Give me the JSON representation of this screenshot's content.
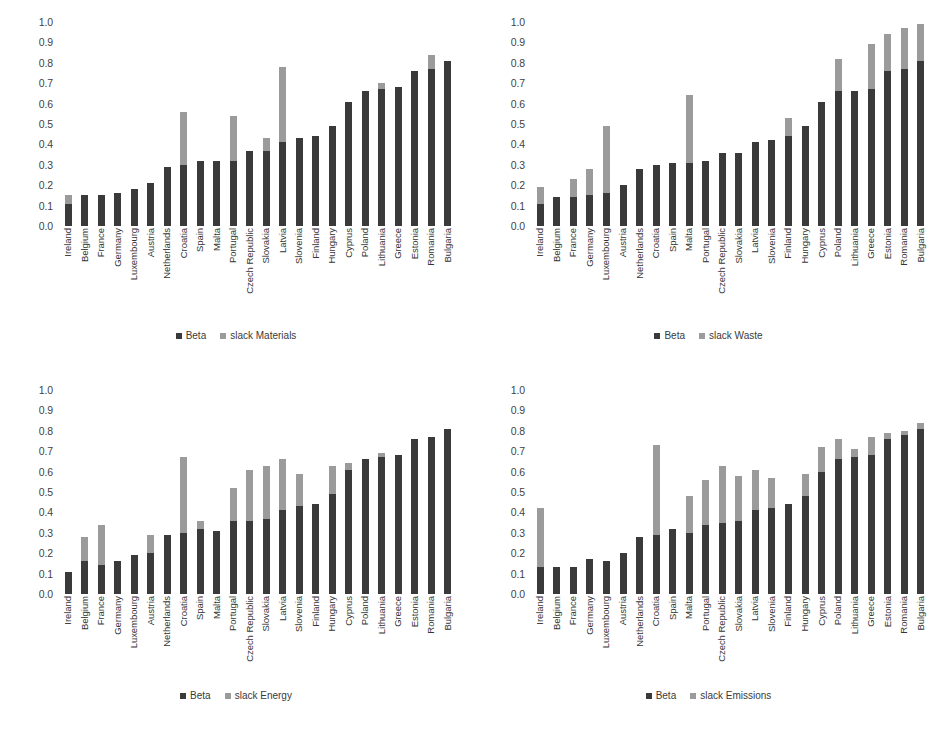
{
  "figure": {
    "colors": {
      "beta": "#3a3a3a",
      "slack": "#9b9b9b",
      "text": "#3a3a3a",
      "background": "#ffffff"
    },
    "y_ticks": [
      "1.0",
      "0.9",
      "0.8",
      "0.7",
      "0.6",
      "0.5",
      "0.4",
      "0.3",
      "0.2",
      "0.1",
      "0.0"
    ],
    "countries": [
      "Ireland",
      "Belgium",
      "France",
      "Germany",
      "Luxembourg",
      "Austria",
      "Netherlands",
      "Croatia",
      "Spain",
      "Malta",
      "Portugal",
      "Czech Republic",
      "Slovakia",
      "Latvia",
      "Slovenia",
      "Finland",
      "Hungary",
      "Cyprus",
      "Poland",
      "Lithuania",
      "Greece",
      "Estonia",
      "Romania",
      "Bulgaria"
    ]
  },
  "chart_data": [
    {
      "panel": "top-left",
      "type": "bar",
      "stacked": true,
      "title": "",
      "xlabel": "",
      "ylabel": "",
      "ylim": [
        0,
        1.0
      ],
      "grid": false,
      "legend_position": "bottom-center",
      "categories": [
        "Ireland",
        "Belgium",
        "France",
        "Germany",
        "Luxembourg",
        "Austria",
        "Netherlands",
        "Croatia",
        "Spain",
        "Malta",
        "Portugal",
        "Czech Republic",
        "Slovakia",
        "Latvia",
        "Slovenia",
        "Finland",
        "Hungary",
        "Cyprus",
        "Poland",
        "Lithuania",
        "Greece",
        "Estonia",
        "Romania",
        "Bulgaria"
      ],
      "series": [
        {
          "name": "Beta",
          "values": [
            0.11,
            0.15,
            0.15,
            0.16,
            0.18,
            0.21,
            0.29,
            0.3,
            0.32,
            0.32,
            0.32,
            0.37,
            0.37,
            0.41,
            0.43,
            0.44,
            0.49,
            0.61,
            0.66,
            0.67,
            0.68,
            0.76,
            0.77,
            0.81
          ]
        },
        {
          "name": "slack Materials",
          "values": [
            0.04,
            0.0,
            0.0,
            0.0,
            0.0,
            0.0,
            0.0,
            0.26,
            0.0,
            0.0,
            0.22,
            0.0,
            0.06,
            0.37,
            0.0,
            0.0,
            0.0,
            0.0,
            0.0,
            0.03,
            0.0,
            0.0,
            0.07,
            0.0
          ]
        }
      ]
    },
    {
      "panel": "top-right",
      "type": "bar",
      "stacked": true,
      "title": "",
      "xlabel": "",
      "ylabel": "",
      "ylim": [
        0,
        1.0
      ],
      "grid": false,
      "legend_position": "bottom-center",
      "categories": [
        "Ireland",
        "Belgium",
        "France",
        "Germany",
        "Luxembourg",
        "Austria",
        "Netherlands",
        "Croatia",
        "Spain",
        "Malta",
        "Portugal",
        "Czech Republic",
        "Slovakia",
        "Latvia",
        "Slovenia",
        "Finland",
        "Hungary",
        "Cyprus",
        "Poland",
        "Lithuania",
        "Greece",
        "Estonia",
        "Romania",
        "Bulgaria"
      ],
      "series": [
        {
          "name": "Beta",
          "values": [
            0.11,
            0.14,
            0.14,
            0.15,
            0.16,
            0.2,
            0.28,
            0.3,
            0.31,
            0.31,
            0.32,
            0.36,
            0.36,
            0.41,
            0.42,
            0.44,
            0.49,
            0.61,
            0.66,
            0.66,
            0.67,
            0.76,
            0.77,
            0.81
          ]
        },
        {
          "name": "slack Waste",
          "values": [
            0.08,
            0.0,
            0.09,
            0.13,
            0.33,
            0.0,
            0.0,
            0.0,
            0.0,
            0.33,
            0.0,
            0.0,
            0.0,
            0.0,
            0.0,
            0.09,
            0.0,
            0.0,
            0.16,
            0.0,
            0.22,
            0.18,
            0.2,
            0.18
          ]
        }
      ]
    },
    {
      "panel": "bottom-left",
      "type": "bar",
      "stacked": true,
      "title": "",
      "xlabel": "",
      "ylabel": "",
      "ylim": [
        0,
        1.0
      ],
      "grid": false,
      "legend_position": "bottom-center",
      "categories": [
        "Ireland",
        "Belgium",
        "France",
        "Germany",
        "Luxembourg",
        "Austria",
        "Netherlands",
        "Croatia",
        "Spain",
        "Malta",
        "Portugal",
        "Czech Republic",
        "Slovakia",
        "Latvia",
        "Slovenia",
        "Finland",
        "Hungary",
        "Cyprus",
        "Poland",
        "Lithuania",
        "Greece",
        "Estonia",
        "Romania",
        "Bulgaria"
      ],
      "series": [
        {
          "name": "Beta",
          "values": [
            0.11,
            0.16,
            0.14,
            0.16,
            0.19,
            0.2,
            0.29,
            0.3,
            0.32,
            0.31,
            0.36,
            0.36,
            0.37,
            0.41,
            0.43,
            0.44,
            0.49,
            0.61,
            0.66,
            0.67,
            0.68,
            0.76,
            0.77,
            0.81
          ]
        },
        {
          "name": "slack Energy",
          "values": [
            0.0,
            0.12,
            0.2,
            0.0,
            0.0,
            0.09,
            0.0,
            0.37,
            0.04,
            0.0,
            0.16,
            0.25,
            0.26,
            0.25,
            0.16,
            0.0,
            0.14,
            0.03,
            0.0,
            0.02,
            0.0,
            0.0,
            0.0,
            0.0
          ]
        }
      ]
    },
    {
      "panel": "bottom-right",
      "type": "bar",
      "stacked": true,
      "title": "",
      "xlabel": "",
      "ylabel": "",
      "ylim": [
        0,
        1.0
      ],
      "grid": false,
      "legend_position": "bottom-center",
      "categories": [
        "Ireland",
        "Belgium",
        "France",
        "Germany",
        "Luxembourg",
        "Austria",
        "Netherlands",
        "Croatia",
        "Spain",
        "Malta",
        "Portugal",
        "Czech Republic",
        "Slovakia",
        "Latvia",
        "Slovenia",
        "Finland",
        "Hungary",
        "Cyprus",
        "Poland",
        "Lithuania",
        "Greece",
        "Estonia",
        "Romania",
        "Bulgaria"
      ],
      "series": [
        {
          "name": "Beta",
          "values": [
            0.13,
            0.13,
            0.13,
            0.17,
            0.16,
            0.2,
            0.28,
            0.29,
            0.32,
            0.3,
            0.34,
            0.35,
            0.36,
            0.41,
            0.42,
            0.44,
            0.48,
            0.6,
            0.66,
            0.67,
            0.68,
            0.76,
            0.78,
            0.81
          ]
        },
        {
          "name": "slack Emissions",
          "values": [
            0.29,
            0.0,
            0.0,
            0.0,
            0.0,
            0.0,
            0.0,
            0.44,
            0.0,
            0.18,
            0.22,
            0.28,
            0.22,
            0.2,
            0.15,
            0.0,
            0.11,
            0.12,
            0.1,
            0.04,
            0.09,
            0.03,
            0.02,
            0.03
          ]
        }
      ]
    }
  ]
}
